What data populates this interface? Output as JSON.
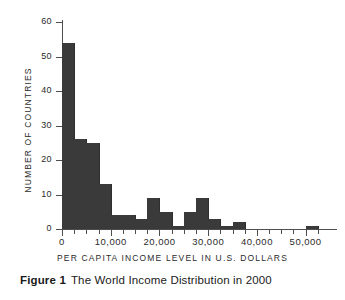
{
  "figure": {
    "number_label": "Figure 1",
    "caption_text": "The World Income Distribution in 2000"
  },
  "colors": {
    "bar_fill": "#3a3a3a",
    "axis": "#4d4d4d",
    "text": "#2b2b2b",
    "background": "#ffffff"
  },
  "chart_data": {
    "type": "bar",
    "title": "",
    "subtitle": "",
    "xlabel": "PER CAPITA INCOME LEVEL IN U.S. DOLLARS",
    "ylabel": "NUMBER OF COUNTRIES",
    "xlim": [
      0,
      55000
    ],
    "ylim": [
      0,
      60
    ],
    "grid": false,
    "legend": null,
    "bin_width": 2500,
    "x_tick_values": [
      0,
      10000,
      20000,
      30000,
      40000,
      50000
    ],
    "x_tick_labels": [
      "0",
      "10,000",
      "20,000",
      "30,000",
      "40,000",
      "50,000"
    ],
    "x_minor_tick_values": [
      2500,
      5000,
      7500,
      12500,
      15000,
      17500,
      22500,
      25000,
      27500,
      32500,
      35000,
      37500,
      42500,
      45000,
      47500,
      52500
    ],
    "y_tick_values": [
      0,
      10,
      20,
      30,
      40,
      50,
      60
    ],
    "y_tick_labels": [
      "0",
      "10",
      "20",
      "30",
      "40",
      "50",
      "60"
    ],
    "categories": [
      "0-2,500",
      "2,500-5,000",
      "5,000-7,500",
      "7,500-10,000",
      "10,000-12,500",
      "12,500-15,000",
      "15,000-17,500",
      "17,500-20,000",
      "20,000-22,500",
      "22,500-25,000",
      "25,000-27,500",
      "27,500-30,000",
      "30,000-32,500",
      "32,500-35,000",
      "35,000-37,500",
      "37,500-40,000",
      "40,000-42,500",
      "42,500-45,000",
      "45,000-47,500",
      "47,500-50,000",
      "50,000-52,500"
    ],
    "bin_starts": [
      0,
      2500,
      5000,
      7500,
      10000,
      12500,
      15000,
      17500,
      20000,
      22500,
      25000,
      27500,
      30000,
      32500,
      35000,
      37500,
      40000,
      42500,
      45000,
      47500,
      50000
    ],
    "values": [
      54,
      26,
      25,
      13,
      4,
      4,
      3,
      9,
      5,
      1,
      5,
      9,
      3,
      1,
      2,
      0,
      0,
      0,
      0,
      0,
      1
    ]
  }
}
